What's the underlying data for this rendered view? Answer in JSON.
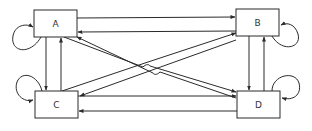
{
  "diagram": {
    "type": "state-transition",
    "colors": {
      "stroke": "#2a2a2a",
      "background": "#ffffff",
      "label": "#333333"
    },
    "nodes": [
      {
        "id": "A",
        "label": "A"
      },
      {
        "id": "B",
        "label": "B"
      },
      {
        "id": "C",
        "label": "C"
      },
      {
        "id": "D",
        "label": "D"
      }
    ],
    "edges": [
      {
        "from": "A",
        "to": "A",
        "kind": "self-loop"
      },
      {
        "from": "B",
        "to": "B",
        "kind": "self-loop"
      },
      {
        "from": "C",
        "to": "C",
        "kind": "self-loop"
      },
      {
        "from": "D",
        "to": "D",
        "kind": "self-loop"
      },
      {
        "from": "A",
        "to": "B"
      },
      {
        "from": "B",
        "to": "A"
      },
      {
        "from": "C",
        "to": "D"
      },
      {
        "from": "D",
        "to": "C"
      },
      {
        "from": "A",
        "to": "C"
      },
      {
        "from": "C",
        "to": "A"
      },
      {
        "from": "B",
        "to": "D"
      },
      {
        "from": "D",
        "to": "B"
      },
      {
        "from": "A",
        "to": "D"
      },
      {
        "from": "D",
        "to": "A"
      },
      {
        "from": "C",
        "to": "B"
      },
      {
        "from": "B",
        "to": "C"
      }
    ]
  }
}
